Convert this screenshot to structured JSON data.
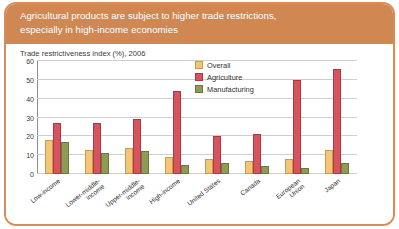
{
  "header": {
    "line1": "Agricultural products are subject to higher trade restrictions,",
    "line2": "especially in high-income economies",
    "band_color": "#d08752",
    "text_color": "#ffffff"
  },
  "frame": {
    "border_color": "#d98c55",
    "background": "#ffffff"
  },
  "source": {
    "text": "Source: World Bank, Global Monitoring Report 2008"
  },
  "legend": {
    "position": "inside-top-right",
    "entries": [
      {
        "label": "Overall",
        "color": "#f5c577"
      },
      {
        "label": "Agriculture",
        "color": "#d9535f"
      },
      {
        "label": "Manufacturing",
        "color": "#8f9b52"
      }
    ]
  },
  "chart_data": {
    "type": "bar",
    "title": "Trade restrictiveness index (%), 2006",
    "xlabel": "",
    "ylabel": "",
    "ylim": [
      0,
      60
    ],
    "yticks": [
      0,
      10,
      20,
      30,
      40,
      50,
      60
    ],
    "ytick_labels": [
      "0",
      "10",
      "20",
      "30",
      "40",
      "50",
      "60"
    ],
    "grid": true,
    "grid_axis": "y",
    "categories": [
      "Low-income",
      "Lower-middle-\nincome",
      "Upper-middle-\nincome",
      "High-income",
      "United States",
      "Canada",
      "European\nUnion",
      "Japan"
    ],
    "series": [
      {
        "name": "Overall",
        "color": "#f5c577",
        "values": [
          18,
          13,
          14,
          9,
          8,
          7,
          8,
          13
        ]
      },
      {
        "name": "Agriculture",
        "color": "#d9535f",
        "values": [
          27,
          27,
          29,
          44,
          20,
          21,
          50,
          56
        ]
      },
      {
        "name": "Manufacturing",
        "color": "#8f9b52",
        "values": [
          17,
          11,
          12,
          5,
          6,
          4,
          3,
          6
        ]
      }
    ]
  }
}
